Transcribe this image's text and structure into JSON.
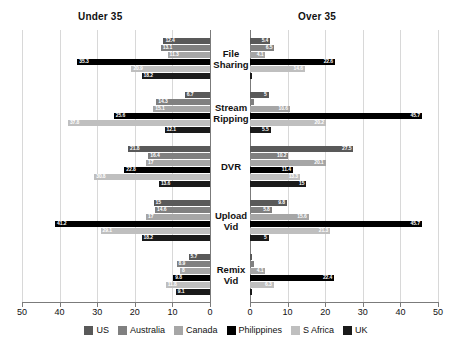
{
  "chart_data": {
    "type": "bar",
    "title": "",
    "subtitle": "",
    "orientation": "horizontal",
    "layout": "mirrored-panels",
    "panels": [
      {
        "key": "under35",
        "label": "Under 35",
        "direction": "left"
      },
      {
        "key": "over35",
        "label": "Over 35",
        "direction": "right"
      }
    ],
    "categories": [
      "File Sharing",
      "Stream Ripping",
      "DVR",
      "Upload Vid",
      "Remix Vid"
    ],
    "category_lines": [
      [
        "File",
        "Sharing"
      ],
      [
        "Stream",
        "Ripping"
      ],
      [
        "DVR",
        ""
      ],
      [
        "Upload",
        "Vid"
      ],
      [
        "Remix",
        "Vid"
      ]
    ],
    "xlabel": "",
    "ylabel": "",
    "xlim": [
      0,
      50
    ],
    "xticks": [
      50,
      40,
      30,
      20,
      10,
      0
    ],
    "xticks_right": [
      0,
      10,
      20,
      30,
      40,
      50
    ],
    "grid": true,
    "grid_axis": "x",
    "legend_position": "bottom",
    "legend": [
      "US",
      "Australia",
      "Canada",
      "Philippines",
      "S Africa",
      "UK"
    ],
    "colors": {
      "US": "#595959",
      "Australia": "#808080",
      "Canada": "#a6a6a6",
      "Philippines": "#000000",
      "S Africa": "#bfbfbf",
      "UK": "#1a1a1a"
    },
    "series": [
      {
        "name": "US",
        "color": "#595959",
        "under35": [
          12.4,
          6.7,
          21.8,
          15.0,
          5.7
        ],
        "over35": [
          5.4,
          5.0,
          27.5,
          9.8,
          0.4
        ]
      },
      {
        "name": "Australia",
        "color": "#808080",
        "under35": [
          13.1,
          14.3,
          16.4,
          14.6,
          8.9
        ],
        "over35": [
          6.5,
          1.0,
          10.2,
          5.8,
          1.0
        ]
      },
      {
        "name": "Canada",
        "color": "#a6a6a6",
        "under35": [
          11.3,
          15.1,
          17.0,
          17.0,
          8.0
        ],
        "over35": [
          4.1,
          10.6,
          20.1,
          15.6,
          4.1
        ]
      },
      {
        "name": "Philippines",
        "color": "#000000",
        "under35": [
          35.3,
          25.6,
          22.8,
          41.2,
          9.8
        ],
        "over35": [
          22.6,
          45.7,
          11.4,
          45.7,
          22.4
        ]
      },
      {
        "name": "S Africa",
        "color": "#bfbfbf",
        "under35": [
          20.9,
          37.8,
          30.8,
          29.1,
          11.8
        ],
        "over35": [
          14.6,
          20.2,
          13.3,
          21.3,
          6.3
        ]
      },
      {
        "name": "UK",
        "color": "#1a1a1a",
        "under35": [
          18.2,
          12.1,
          13.6,
          18.2,
          9.1
        ],
        "over35": [
          0.6,
          5.5,
          15.0,
          5.0,
          0.5
        ]
      }
    ]
  }
}
